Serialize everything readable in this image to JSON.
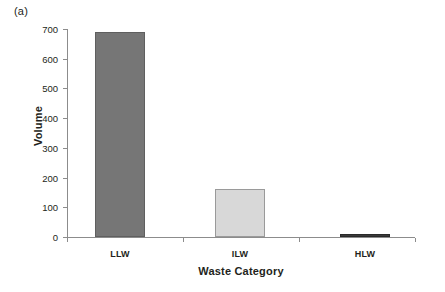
{
  "panel": {
    "label": "(a)"
  },
  "chart_data": {
    "type": "bar",
    "title": "",
    "subtitle": "",
    "xlabel": "Waste Category",
    "ylabel": "Volume",
    "categories": [
      "LLW",
      "ILW",
      "HLW"
    ],
    "values": [
      690,
      160,
      5
    ],
    "series": [
      {
        "name": "Volume",
        "values": [
          690,
          160,
          5
        ]
      }
    ],
    "ylim": [
      0,
      700
    ],
    "ytick_labels": [
      "0",
      "100",
      "200",
      "300",
      "400",
      "500",
      "600",
      "700"
    ],
    "ytick_values": [
      0,
      100,
      200,
      300,
      400,
      500,
      600,
      700
    ],
    "grid": false,
    "legend": "none",
    "bar_colors": [
      "#767676",
      "#d8d8d8",
      "#3a3a3a"
    ],
    "bar_edge_colors": [
      "#5f5f5f",
      "#9a9a9a",
      "#2a2a2a"
    ],
    "annotations": [
      "(a)"
    ]
  }
}
